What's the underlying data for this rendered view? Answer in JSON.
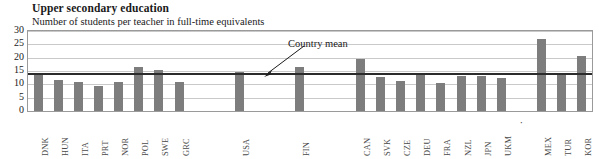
{
  "header": {
    "title": "Upper secondary education",
    "subtitle": "Number of students per teacher in full-time equivalents"
  },
  "annotations": {
    "country_mean_label": "Country mean"
  },
  "colors": {
    "bar": "#7d7d7d",
    "mean_line": "#2b2b2b",
    "gridline": "#c9c9c9",
    "plot_border": "#9a9a9a"
  },
  "chart_data": {
    "type": "bar",
    "title": "Upper secondary education",
    "subtitle": "Number of students per teacher in full-time equivalents",
    "xlabel": "",
    "ylabel": "",
    "ylim": [
      0,
      30
    ],
    "yticks": [
      30,
      25,
      20,
      15,
      10,
      5,
      0
    ],
    "grid": true,
    "legend": false,
    "country_mean": 13.8,
    "categories": [
      "DNK",
      "HUN",
      "ITA",
      "PRT",
      "NOR",
      "POL",
      "SWE",
      "GRC",
      "",
      "",
      "USA",
      "",
      "",
      "FIN",
      "",
      "",
      "CAN",
      "SVK",
      "CZE",
      "DEU",
      "FRA",
      "NZL",
      "JPN",
      "UKM",
      "·",
      "MEX",
      "TUR",
      "KOR"
    ],
    "values": [
      14.3,
      11.5,
      10.8,
      9.2,
      11.0,
      16.5,
      15.3,
      11.0,
      null,
      null,
      14.5,
      null,
      null,
      16.5,
      null,
      null,
      19.5,
      12.7,
      11.3,
      13.8,
      10.6,
      13.3,
      13.2,
      12.5,
      null,
      27.0,
      14.0,
      20.5
    ],
    "annotations": [
      {
        "text": "Country mean",
        "points_to": "mean_line"
      }
    ]
  }
}
